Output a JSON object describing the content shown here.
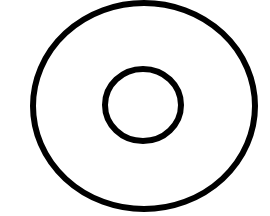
{
  "diagram": {
    "shape": "concentric-rings",
    "background": "#ffffff",
    "stroke_color": "#000000",
    "outer_ring": {
      "cx": 144,
      "cy": 106,
      "rx": 111,
      "ry": 103,
      "stroke_width": 6
    },
    "inner_ring": {
      "cx": 143,
      "cy": 105,
      "rx": 38,
      "ry": 36,
      "stroke_width": 6
    }
  }
}
